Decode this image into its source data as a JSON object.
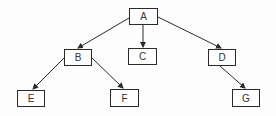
{
  "diagram": {
    "type": "tree",
    "nodes": [
      {
        "id": "A",
        "label": "A",
        "x": 129,
        "y": 8,
        "w": 29,
        "h": 17
      },
      {
        "id": "B",
        "label": "B",
        "x": 64,
        "y": 49,
        "w": 28,
        "h": 17
      },
      {
        "id": "C",
        "label": "C",
        "x": 128,
        "y": 48,
        "w": 29,
        "h": 17
      },
      {
        "id": "D",
        "label": "D",
        "x": 208,
        "y": 49,
        "w": 28,
        "h": 17
      },
      {
        "id": "E",
        "label": "E",
        "x": 17,
        "y": 90,
        "w": 28,
        "h": 17
      },
      {
        "id": "F",
        "label": "F",
        "x": 110,
        "y": 89,
        "w": 29,
        "h": 18
      },
      {
        "id": "G",
        "label": "G",
        "x": 232,
        "y": 89,
        "w": 28,
        "h": 18
      }
    ],
    "edges": [
      {
        "from": "A",
        "to": "B"
      },
      {
        "from": "A",
        "to": "C"
      },
      {
        "from": "A",
        "to": "D"
      },
      {
        "from": "B",
        "to": "E"
      },
      {
        "from": "B",
        "to": "F"
      },
      {
        "from": "D",
        "to": "G"
      }
    ],
    "edge_color": "#2a2a2a"
  }
}
